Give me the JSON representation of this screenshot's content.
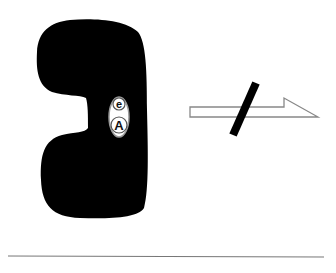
{
  "diagram": {
    "type": "enzyme-inhibition-schematic",
    "enzyme": {
      "shape": "black-blob",
      "color": "#000000"
    },
    "bound_complex": {
      "top_label": "e",
      "bottom_label": "A",
      "fill": "#ffffff",
      "stroke": "#888888"
    },
    "reaction_arrow": {
      "direction": "right",
      "style": "half-headed-outline",
      "blocked": true,
      "block_color": "#000000"
    },
    "baseline": {
      "color": "#777777"
    }
  }
}
